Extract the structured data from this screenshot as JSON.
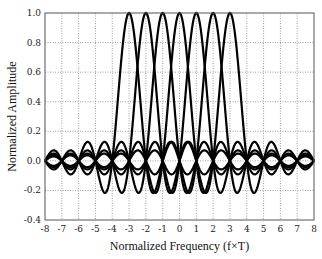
{
  "chart_data": {
    "type": "line",
    "title": "",
    "xlabel": "Normalized Frequency (f×T)",
    "ylabel": "Normalized Amplitude",
    "xlim": [
      -8,
      8
    ],
    "ylim": [
      -0.4,
      1.0
    ],
    "xticks": [
      "-8",
      "-7",
      "-6",
      "-5",
      "-4",
      "-3",
      "-2",
      "-1",
      "0",
      "1",
      "2",
      "3",
      "4",
      "5",
      "6",
      "7",
      "8"
    ],
    "yticks": [
      "-0.4",
      "-0.2",
      "0.0",
      "0.2",
      "0.4",
      "0.6",
      "0.8",
      "1.0"
    ],
    "grid": true,
    "legend": "none",
    "function": "sinc(f - k) = sin(pi(f-k)) / (pi(f-k))",
    "series": [
      {
        "name": "subcarrier -3",
        "center": -3
      },
      {
        "name": "subcarrier -2",
        "center": -2
      },
      {
        "name": "subcarrier -1",
        "center": -1
      },
      {
        "name": "subcarrier 0",
        "center": 0
      },
      {
        "name": "subcarrier 1",
        "center": 1
      },
      {
        "name": "subcarrier 2",
        "center": 2
      },
      {
        "name": "subcarrier 3",
        "center": 3
      }
    ],
    "line_color": "#000000",
    "grid_color": "#888888"
  }
}
